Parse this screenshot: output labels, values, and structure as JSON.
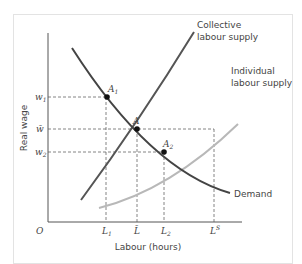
{
  "diagram": {
    "type": "labour-market-supply-demand",
    "x_axis": {
      "label": "Labour (hours)",
      "origin_label": "O",
      "ticks": [
        {
          "id": "L1",
          "label": "L",
          "sub": "1"
        },
        {
          "id": "Lbar",
          "label": "L̄",
          "sub": ""
        },
        {
          "id": "L2",
          "label": "L",
          "sub": "2"
        },
        {
          "id": "LS",
          "label": "L",
          "sup": "S"
        }
      ]
    },
    "y_axis": {
      "label": "Real wage",
      "ticks": [
        {
          "id": "w1",
          "label": "w",
          "sub": "1"
        },
        {
          "id": "wbar",
          "label": "w̄",
          "sub": ""
        },
        {
          "id": "w2",
          "label": "w",
          "sub": "2"
        }
      ]
    },
    "curves": [
      {
        "id": "collective",
        "label_line1": "Collective",
        "label_line2": "labour supply",
        "color": "#555555"
      },
      {
        "id": "individual",
        "label_line1": "Individual",
        "label_line2": "labour supply",
        "color": "#b5b5b5"
      },
      {
        "id": "demand",
        "label": "Demand",
        "color": "#444444"
      }
    ],
    "points": [
      {
        "id": "A1",
        "label": "A",
        "sub": "1"
      },
      {
        "id": "A",
        "label": "A",
        "sub": ""
      },
      {
        "id": "A2",
        "label": "A",
        "sub": "2"
      }
    ]
  }
}
